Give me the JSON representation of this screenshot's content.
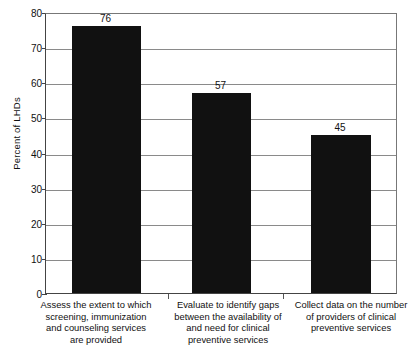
{
  "chart_data": {
    "type": "bar",
    "title": "",
    "xlabel": "",
    "ylabel": "Percent of LHDs",
    "ylim": [
      0,
      80
    ],
    "ytick_labels": [
      "80",
      "70",
      "60",
      "50",
      "40",
      "30",
      "20",
      "10",
      "0"
    ],
    "yticks": [
      80,
      70,
      60,
      50,
      40,
      30,
      20,
      10,
      0
    ],
    "grid": true,
    "legend": null,
    "bar_color": "#111111",
    "categories": [
      "Assess the extent to which screening, immunization and counseling services are provided",
      "Evaluate to identify gaps between the availability of and need for clinical preventive services",
      "Collect data on the number of providers of clinical preventive services"
    ],
    "category_lines": [
      [
        "Assess the extent to which",
        "screening, immunization",
        "and counseling services",
        "are provided"
      ],
      [
        "Evaluate to identify gaps",
        "between the availability of",
        "and need for clinical",
        "preventive services"
      ],
      [
        "Collect data on the number",
        "of providers of clinical",
        "preventive services"
      ]
    ],
    "values": [
      76,
      57,
      45
    ],
    "value_labels": [
      "76",
      "57",
      "45"
    ]
  }
}
